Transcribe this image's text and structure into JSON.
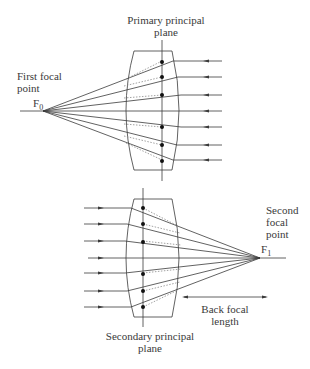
{
  "top_diagram": {
    "plane_label_line1": "Primary principal",
    "plane_label_line2": "plane",
    "focal_label_line1": "First focal",
    "focal_label_line2": "point",
    "focal_symbol": "F",
    "focal_subscript": "0"
  },
  "bottom_diagram": {
    "plane_label_line1": "Secondary principal",
    "plane_label_line2": "plane",
    "focal_label_line1": "Second",
    "focal_label_line2": "focal",
    "focal_label_line3": "point",
    "focal_symbol": "F",
    "focal_subscript": "1",
    "distance_label_line1": "Back focal",
    "distance_label_line2": "length"
  },
  "colors": {
    "line": "#3a3a3a",
    "dotted": "#8a8a8a",
    "dot": "#111111"
  }
}
